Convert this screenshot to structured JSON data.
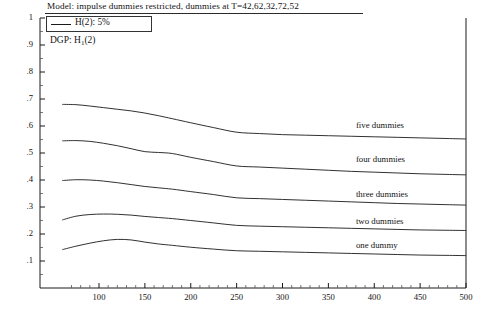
{
  "chart_data": {
    "type": "line",
    "title": "Model: impulse dummies restricted, dummies at T=42,62,32,72,52",
    "subtitle": "DGP: H",
    "subtitle_sub": "1",
    "subtitle_tail": "(2)",
    "legend": {
      "position": "top-left",
      "entries": [
        {
          "label": "H(2): 5%",
          "marker": "line"
        }
      ]
    },
    "xlabel": "",
    "ylabel": "",
    "xlim": [
      60,
      500
    ],
    "ylim": [
      0,
      1
    ],
    "grid": false,
    "xticks": [
      100,
      150,
      200,
      250,
      300,
      350,
      400,
      450,
      500
    ],
    "xtick_labels": [
      "100",
      "150",
      "200",
      "250",
      "300",
      "350",
      "400",
      "450",
      "500"
    ],
    "yticks": [
      0.1,
      0.2,
      0.3,
      0.4,
      0.5,
      0.6,
      0.7,
      0.8,
      0.9,
      1
    ],
    "ytick_labels": [
      ".1",
      ".2",
      ".3",
      ".4",
      ".5",
      ".6",
      ".7",
      ".8",
      ".9",
      "1"
    ],
    "x": [
      60,
      75,
      90,
      105,
      120,
      135,
      150,
      165,
      180,
      200,
      225,
      250,
      275,
      300,
      325,
      350,
      375,
      400,
      425,
      450,
      475,
      500
    ],
    "series": [
      {
        "name": "five dummies",
        "label": "five dummies",
        "label_x": 380,
        "label_y": 0.6,
        "values": [
          0.68,
          0.679,
          0.674,
          0.668,
          0.662,
          0.656,
          0.648,
          0.638,
          0.627,
          0.612,
          0.594,
          0.577,
          0.572,
          0.568,
          0.566,
          0.564,
          0.562,
          0.56,
          0.558,
          0.556,
          0.554,
          0.552
        ]
      },
      {
        "name": "four dummies",
        "label": "four dummies",
        "label_x": 380,
        "label_y": 0.475,
        "values": [
          0.545,
          0.546,
          0.543,
          0.536,
          0.527,
          0.516,
          0.505,
          0.502,
          0.498,
          0.484,
          0.468,
          0.452,
          0.448,
          0.444,
          0.44,
          0.436,
          0.432,
          0.429,
          0.426,
          0.423,
          0.421,
          0.419
        ]
      },
      {
        "name": "three dummies",
        "label": "three dummies",
        "label_x": 380,
        "label_y": 0.345,
        "values": [
          0.398,
          0.401,
          0.4,
          0.396,
          0.39,
          0.383,
          0.376,
          0.371,
          0.366,
          0.357,
          0.346,
          0.334,
          0.331,
          0.328,
          0.325,
          0.322,
          0.319,
          0.316,
          0.313,
          0.311,
          0.309,
          0.307
        ]
      },
      {
        "name": "two dummies",
        "label": "two dummies",
        "label_x": 380,
        "label_y": 0.245,
        "values": [
          0.252,
          0.266,
          0.272,
          0.274,
          0.273,
          0.27,
          0.265,
          0.261,
          0.257,
          0.25,
          0.241,
          0.232,
          0.229,
          0.227,
          0.225,
          0.223,
          0.221,
          0.219,
          0.217,
          0.215,
          0.214,
          0.213
        ]
      },
      {
        "name": "one dummy",
        "label": "one dummy",
        "label_x": 380,
        "label_y": 0.155,
        "values": [
          0.142,
          0.155,
          0.166,
          0.175,
          0.18,
          0.178,
          0.17,
          0.163,
          0.158,
          0.151,
          0.144,
          0.138,
          0.136,
          0.134,
          0.132,
          0.13,
          0.128,
          0.126,
          0.124,
          0.122,
          0.121,
          0.12
        ]
      }
    ]
  },
  "axes": {
    "line_color": "#1a1a1a"
  }
}
